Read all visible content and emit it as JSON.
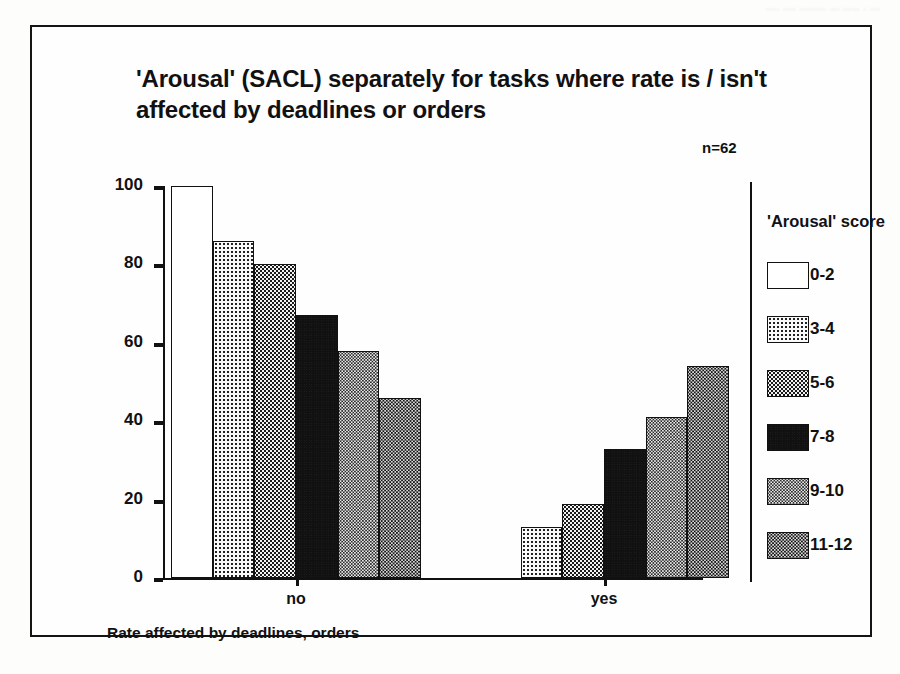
{
  "page_header": "....  ....  ........  ...  .....   .   ...",
  "figure": {
    "title": "'Arousal' (SACL) separately for tasks where rate is / isn't affected by deadlines or orders",
    "sample_size_label": "n=62",
    "y_axis_title": "Percent of employees (within each 'Arousal' category)",
    "x_axis_title": "Rate affected by deadlines, orders",
    "legend_title": "'Arousal'  score"
  },
  "chart_data": {
    "type": "bar",
    "title": "'Arousal' (SACL) separately for tasks where rate is / isn't affected by deadlines or orders",
    "subtitle": "n=62",
    "xlabel": "Rate affected by deadlines, orders",
    "ylabel": "Percent of employees (within each 'Arousal' category)",
    "ylim": [
      0,
      100
    ],
    "yticks": [
      0,
      20,
      40,
      60,
      80,
      100
    ],
    "ytick_labels": [
      "0",
      "20",
      "40",
      "60",
      "80",
      "100"
    ],
    "grid": false,
    "legend_position": "right",
    "legend_title": "'Arousal'  score",
    "categories": [
      "no",
      "yes"
    ],
    "series": [
      {
        "name": "0-2",
        "fill": "f0",
        "values": [
          100,
          0
        ]
      },
      {
        "name": "3-4",
        "fill": "f1",
        "values": [
          86,
          13
        ]
      },
      {
        "name": "5-6",
        "fill": "f2",
        "values": [
          80,
          19
        ]
      },
      {
        "name": "7-8",
        "fill": "f3",
        "values": [
          67,
          33
        ]
      },
      {
        "name": "9-10",
        "fill": "f4",
        "values": [
          58,
          41
        ]
      },
      {
        "name": "11-12",
        "fill": "f5",
        "values": [
          46,
          54
        ]
      }
    ]
  },
  "colors": {
    "ink": "#111111",
    "paper": "#fefefe"
  }
}
